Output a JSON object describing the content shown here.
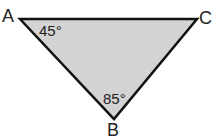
{
  "diagram": {
    "type": "triangle",
    "fill_color": "#d3d3d3",
    "stroke_color": "#111111",
    "vertices": [
      {
        "label": "A",
        "x": 20,
        "y": 19,
        "angle": "45°"
      },
      {
        "label": "C",
        "x": 197,
        "y": 19,
        "angle": ""
      },
      {
        "label": "B",
        "x": 114,
        "y": 119,
        "angle": "85°"
      }
    ]
  }
}
